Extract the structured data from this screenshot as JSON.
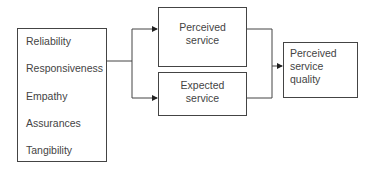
{
  "diagram": {
    "dimensions_box": {
      "items": [
        "Reliability",
        "Responsiveness",
        "Empathy",
        "Assurances",
        "Tangibility"
      ]
    },
    "perceived_service": {
      "line1": "Perceived",
      "line2": "service"
    },
    "expected_service": {
      "line1": "Expected",
      "line2": "service"
    },
    "output": {
      "line1": "Perceived",
      "line2": "service",
      "line3": "quality"
    },
    "colors": {
      "stroke": "#444444",
      "text": "#444444",
      "background": "#ffffff"
    }
  }
}
